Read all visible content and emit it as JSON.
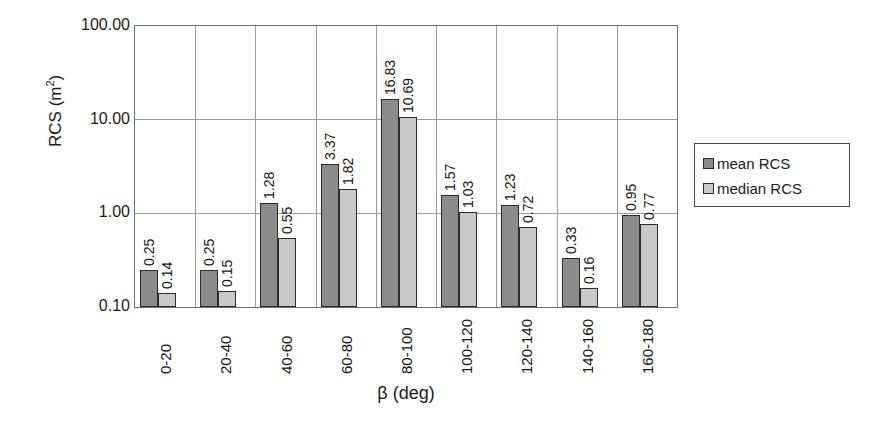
{
  "chart_data": {
    "type": "bar",
    "title": "",
    "xlabel": "β (deg)",
    "ylabel": "RCS (m²)",
    "ylabel_base": "RCS (m",
    "ylabel_sup": "2",
    "ylabel_tail": ")",
    "yscale": "log",
    "ylim": [
      0.1,
      100.0
    ],
    "ytick_labels": [
      "100.00",
      "10.00",
      "1.00",
      "0.10"
    ],
    "ytick_values": [
      100.0,
      10.0,
      1.0,
      0.1
    ],
    "grid": "both",
    "legend_position": "right",
    "categories": [
      "0-20",
      "20-40",
      "40-60",
      "60-80",
      "80-100",
      "100-120",
      "120-140",
      "140-160",
      "160-180"
    ],
    "series": [
      {
        "name": "mean RCS",
        "color": "#8c8c8c",
        "values": [
          0.25,
          0.25,
          1.28,
          3.37,
          16.83,
          1.57,
          1.23,
          0.33,
          0.95
        ],
        "labels": [
          "0.25",
          "0.25",
          "1.28",
          "3.37",
          "16.83",
          "1.57",
          "1.23",
          "0.33",
          "0.95"
        ]
      },
      {
        "name": "median RCS",
        "color": "#c9c9c9",
        "values": [
          0.14,
          0.15,
          0.55,
          1.82,
          10.69,
          1.03,
          0.72,
          0.16,
          0.77
        ],
        "labels": [
          "0.14",
          "0.15",
          "0.55",
          "1.82",
          "10.69",
          "1.03",
          "0.72",
          "0.16",
          "0.77"
        ]
      }
    ]
  },
  "legend": {
    "items": [
      {
        "label": "mean RCS",
        "swatch": "mean"
      },
      {
        "label": "median RCS",
        "swatch": "median"
      }
    ]
  }
}
